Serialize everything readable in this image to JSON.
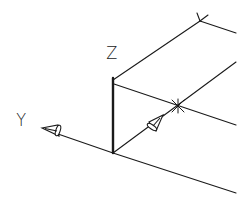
{
  "diagram": {
    "type": "isometric-ucs-icon",
    "labels": {
      "z_axis": "Z",
      "y_axis": "Y"
    },
    "colors": {
      "line": "#1a1a1a",
      "background": "#ffffff"
    },
    "points": {
      "origin": [
        113,
        153
      ],
      "z_top": [
        113,
        78
      ],
      "top_corner": [
        200,
        21
      ],
      "mid_marker": [
        178,
        106
      ],
      "y_arrow_tip": [
        42,
        128
      ]
    }
  }
}
